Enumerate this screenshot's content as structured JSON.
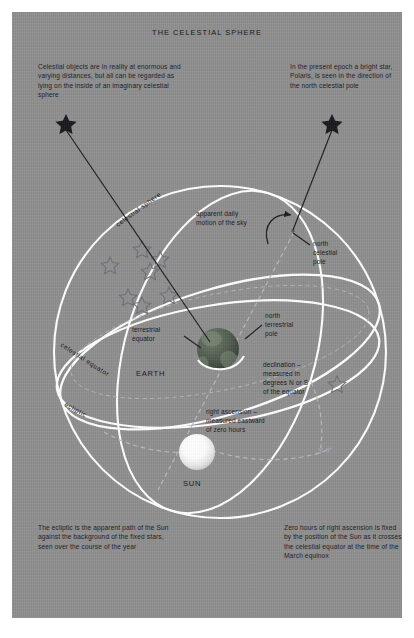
{
  "document": {
    "title": "THE CELESTIAL SPHERE",
    "background_color": "#8e8e8e",
    "page_color": "#ffffff",
    "text_color": "#1a1a22",
    "sphere_line_color": "#ffffff",
    "dashed_line_color": "#b9b9c2"
  },
  "notes": {
    "top_left": "Celestial objects are in reality at enormous and varying distances, but all can be regarded as lying on the inside of an imaginary celestial sphere",
    "top_right": "In the present epoch a bright star, Polaris, is seen in the direction of the north celestial pole",
    "bottom_left": "The ecliptic is the apparent path of the Sun against the background of the fixed stars, seen over the course of the year",
    "bottom_right": "Zero hours of right ascension is fixed by the position of the Sun as it crosses the celestial equator at the time of the March equinox"
  },
  "labels": {
    "celestial_sphere": "celestial sphere",
    "celestial_equator": "celestial equator",
    "ecliptic": "ecliptic",
    "apparent_daily_motion": "apparent daily\nmotion of the sky",
    "north_celestial_pole": "north\ncelestial\npole",
    "north_terrestrial_pole": "north\nterrestrial\npole",
    "terrestrial_equator": "terrestrial\nequator",
    "earth": "EARTH",
    "sun": "SUN",
    "declination": "declination –\nmeasured in\ndegrees N or S\nof the equator",
    "right_ascension": "right ascension –\nmeasured eastward\nof zero hours"
  },
  "diagram": {
    "type": "astronomical-illustration",
    "bodies": [
      {
        "name": "earth",
        "label": "EARTH",
        "cx": 206,
        "cy": 337,
        "r": 21,
        "color": "#4e5a4e"
      },
      {
        "name": "sun",
        "label": "SUN",
        "cx": 185,
        "cy": 440,
        "r": 18,
        "color": "#ffffff"
      }
    ],
    "markers": [
      {
        "name": "north-celestial-pole-dot",
        "cx": 281,
        "cy": 219,
        "r": 1.6
      },
      {
        "name": "polaris-star",
        "cx": 331,
        "cy": 114,
        "size": 12
      },
      {
        "name": "celestial-sphere-star",
        "cx": 63,
        "cy": 124,
        "size": 11
      }
    ],
    "field_stars_count": 7,
    "rings": [
      {
        "name": "celestial-sphere-outline",
        "kind": "circle",
        "cx": 208,
        "cy": 340,
        "r": 166
      },
      {
        "name": "celestial-equator",
        "kind": "ellipse",
        "cx": 208,
        "cy": 340,
        "rx": 166,
        "ry": 63,
        "rotate": -17
      },
      {
        "name": "ecliptic",
        "kind": "ellipse",
        "cx": 208,
        "cy": 340,
        "rx": 164,
        "ry": 60,
        "rotate": 6
      },
      {
        "name": "tilted-great-circle",
        "kind": "ellipse",
        "cx": 208,
        "cy": 340,
        "rx": 95,
        "ry": 166,
        "rotate": 17
      }
    ],
    "dashed_paths": [
      {
        "name": "polar-axis",
        "from": [
          281,
          219
        ],
        "to": [
          147,
          475
        ]
      },
      {
        "name": "declination-arc"
      },
      {
        "name": "right-ascension-arc"
      }
    ]
  }
}
